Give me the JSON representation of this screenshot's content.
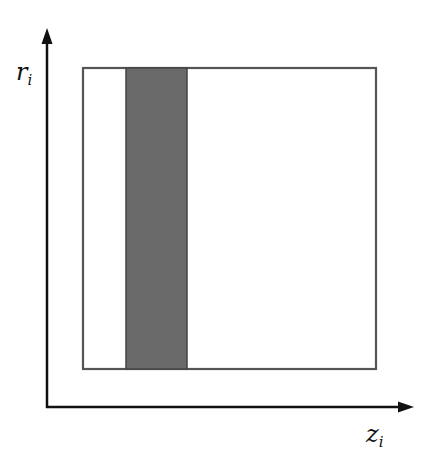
{
  "diagram": {
    "y_axis_label": {
      "var": "r",
      "sub": "i"
    },
    "x_axis_label": {
      "var": "z",
      "sub": "i"
    },
    "outer_rect": {
      "x": 83,
      "y": 68,
      "w": 293,
      "h": 301
    },
    "shaded_band": {
      "x": 126,
      "y": 68,
      "w": 61,
      "h": 301,
      "fill": "#6a6a6a"
    },
    "axes": {
      "origin_x": 47,
      "origin_y": 407,
      "y_tip": 28,
      "x_tip": 414
    }
  }
}
